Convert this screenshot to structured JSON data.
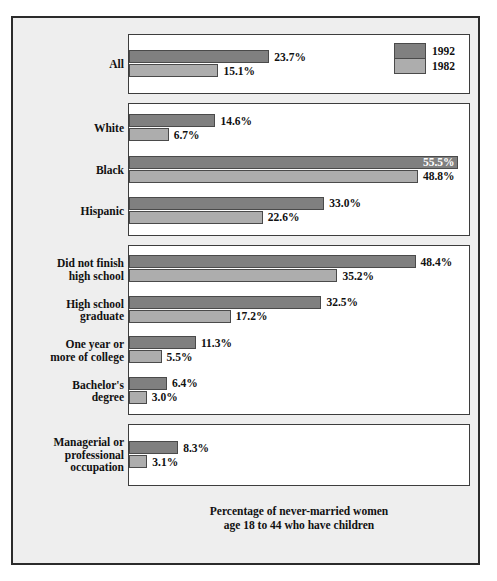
{
  "caption": "Percentage of never-married women\nage 18 to 44 who have children",
  "colors": {
    "series_1992": "#808080",
    "series_1982": "#adadad",
    "panel_background": "#ffffff",
    "plate_background": "#eeeeee",
    "frame_border": "#2b2b2b",
    "text": "#111111",
    "inside_label_text": "#ffffff"
  },
  "legend": {
    "entries": [
      {
        "label": "1992",
        "color": "#808080"
      },
      {
        "label": "1982",
        "color": "#adadad"
      }
    ]
  },
  "chart_data": {
    "type": "bar",
    "orientation": "horizontal",
    "title": "",
    "subtitle": "",
    "xlabel": "Percentage of never-married women age 18 to 44 who have children",
    "ylabel": "",
    "xlim": [
      0,
      58
    ],
    "grid": false,
    "legend_position": "top-right",
    "value_suffix": "%",
    "series": [
      {
        "name": "1992",
        "color": "#808080",
        "values": [
          23.7,
          14.6,
          55.5,
          33.0,
          48.4,
          32.5,
          11.3,
          6.4,
          8.3
        ]
      },
      {
        "name": "1982",
        "color": "#adadad",
        "values": [
          15.1,
          6.7,
          48.8,
          22.6,
          35.2,
          17.2,
          5.5,
          3.0,
          3.1
        ]
      }
    ],
    "categories": [
      "All",
      "White",
      "Black",
      "Hispanic",
      "Did not finish high school",
      "High school graduate",
      "One year or more of college",
      "Bachelor's degree",
      "Managerial or professional occupation"
    ],
    "groups": [
      {
        "name": "overall",
        "rows": [
          {
            "label": "All",
            "v1992": "23.7%",
            "v1982": "15.1%",
            "n1992": 23.7,
            "n1982": 15.1
          }
        ]
      },
      {
        "name": "race-ethnicity",
        "rows": [
          {
            "label": "White",
            "v1992": "14.6%",
            "v1982": "6.7%",
            "n1992": 14.6,
            "n1982": 6.7
          },
          {
            "label": "Black",
            "v1992": "55.5%",
            "v1982": "48.8%",
            "n1992": 55.5,
            "n1982": 48.8
          },
          {
            "label": "Hispanic",
            "v1992": "33.0%",
            "v1982": "22.6%",
            "n1992": 33.0,
            "n1982": 22.6
          }
        ]
      },
      {
        "name": "education",
        "rows": [
          {
            "label": "Did not finish\nhigh school",
            "v1992": "48.4%",
            "v1982": "35.2%",
            "n1992": 48.4,
            "n1982": 35.2
          },
          {
            "label": "High school\ngraduate",
            "v1992": "32.5%",
            "v1982": "17.2%",
            "n1992": 32.5,
            "n1982": 17.2
          },
          {
            "label": "One year or\nmore of college",
            "v1992": "11.3%",
            "v1982": "5.5%",
            "n1992": 11.3,
            "n1982": 5.5
          },
          {
            "label": "Bachelor's\ndegree",
            "v1992": "6.4%",
            "v1982": "3.0%",
            "n1992": 6.4,
            "n1982": 3.0
          }
        ]
      },
      {
        "name": "occupation",
        "rows": [
          {
            "label": "Managerial or\nprofessional\noccupation",
            "v1992": "8.3%",
            "v1982": "3.1%",
            "n1992": 8.3,
            "n1982": 3.1
          }
        ]
      }
    ]
  },
  "layout": {
    "px_per_percent": 5.92,
    "panels": [
      {
        "top": 16,
        "height": 60
      },
      {
        "top": 85,
        "height": 133
      },
      {
        "top": 227,
        "height": 170
      },
      {
        "top": 406,
        "height": 62
      }
    ],
    "caption_top": 487
  }
}
